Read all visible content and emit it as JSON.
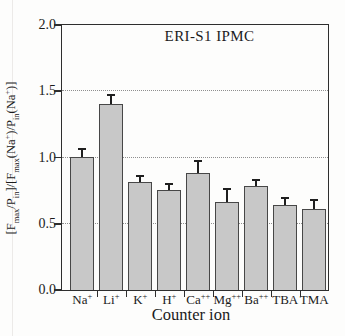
{
  "chart_data": {
    "type": "bar",
    "title": "ERI-S1 IPMC",
    "xlabel": "Counter ion",
    "ylabel": "[Fmax/Pin]/[Fmax(Na+)/Pin(Na+)]",
    "categories": [
      {
        "base": "Na",
        "sup": "+"
      },
      {
        "base": "Li",
        "sup": "+"
      },
      {
        "base": "K",
        "sup": "+"
      },
      {
        "base": "H",
        "sup": "+"
      },
      {
        "base": "Ca",
        "sup": "++"
      },
      {
        "base": "Mg",
        "sup": "++"
      },
      {
        "base": "Ba",
        "sup": "++"
      },
      {
        "base": "TBA",
        "sup": ""
      },
      {
        "base": "TMA",
        "sup": ""
      }
    ],
    "categories_text": [
      "Na+",
      "Li+",
      "K+",
      "H+",
      "Ca++",
      "Mg++",
      "Ba++",
      "TBA",
      "TMA"
    ],
    "values": [
      1.0,
      1.4,
      0.81,
      0.75,
      0.88,
      0.66,
      0.78,
      0.64,
      0.61
    ],
    "errors": [
      0.06,
      0.07,
      0.05,
      0.05,
      0.09,
      0.1,
      0.05,
      0.05,
      0.07
    ],
    "error_direction": "upper-only",
    "ylim": [
      0.0,
      2.0
    ],
    "ytick_values": [
      0,
      0.5,
      1.0,
      1.5,
      2.0
    ],
    "ytick_labels": [
      "0.0",
      "0.5",
      "1.0",
      "1.5",
      "2.0"
    ],
    "gridline_values": [
      0.5,
      1.0,
      1.5
    ],
    "grid_style": "dotted-horizontal",
    "legend": "none",
    "colors": {
      "bar_fill": "#c8c8c8",
      "bar_border": "#474747",
      "frame": "#2e2e2e",
      "grid": "#8f8f8f",
      "error_bar": "#1f1f1f",
      "text": "#1b1b1b",
      "background": "#fdfdfc"
    }
  },
  "ylabel_rich": {
    "p1": "[F",
    "s1": "max",
    "p2": "/P",
    "s2": "in",
    "p3": "]/[F",
    "s3": "max",
    "p4": "(Na",
    "sp4": "+",
    "p5": ")/P",
    "s5": "in",
    "p6": "(Na",
    "sp6": "+",
    "p7": ")]"
  }
}
